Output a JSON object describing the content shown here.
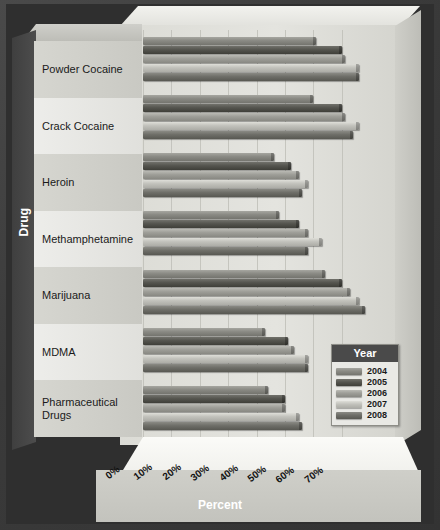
{
  "chart_data": {
    "type": "bar",
    "orientation": "horizontal",
    "title": "",
    "xlabel": "Percent",
    "ylabel": "Drug",
    "xlim": [
      0,
      76
    ],
    "xticks": [
      "0%",
      "10%",
      "20%",
      "30%",
      "40%",
      "50%",
      "60%",
      "70%"
    ],
    "xtick_values": [
      0,
      10,
      20,
      30,
      40,
      50,
      60,
      70
    ],
    "grid": true,
    "legend_position": "inside-lower-right",
    "legend_title": "Year",
    "categories": [
      "Powder Cocaine",
      "Crack Cocaine",
      "Heroin",
      "Methamphetamine",
      "Marijuana",
      "MDMA",
      "Pharmaceutical Drugs"
    ],
    "series": [
      {
        "name": "2004",
        "color": "#8a8a84",
        "values": [
          61,
          60,
          46,
          48,
          64,
          43,
          44
        ]
      },
      {
        "name": "2005",
        "color": "#55554f",
        "values": [
          70,
          70,
          52,
          55,
          70,
          51,
          50
        ]
      },
      {
        "name": "2006",
        "color": "#9e9e98",
        "values": [
          71,
          71,
          55,
          58,
          73,
          53,
          50
        ]
      },
      {
        "name": "2007",
        "color": "#c2c2bc",
        "values": [
          76,
          76,
          58,
          63,
          76,
          58,
          55
        ]
      },
      {
        "name": "2008",
        "color": "#6e6e68",
        "values": [
          76,
          74,
          56,
          58,
          78,
          58,
          56
        ]
      }
    ]
  },
  "axis": {
    "y_title": "Drug",
    "x_title": "Percent"
  },
  "legend": {
    "title": "Year",
    "items": [
      {
        "label": "2004",
        "color": "#8a8a84"
      },
      {
        "label": "2005",
        "color": "#55554f"
      },
      {
        "label": "2006",
        "color": "#9e9e98"
      },
      {
        "label": "2007",
        "color": "#c2c2bc"
      },
      {
        "label": "2008",
        "color": "#6e6e68"
      }
    ]
  }
}
